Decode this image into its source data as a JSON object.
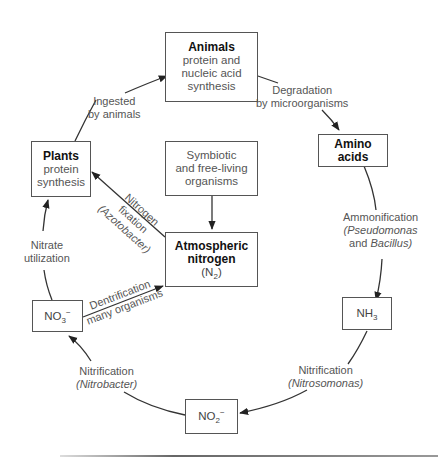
{
  "diagram": {
    "nodes": {
      "animals": {
        "title": "Animals",
        "lines": [
          "protein and",
          "nucleic acid",
          "synthesis"
        ]
      },
      "amino_acids": {
        "title": "Amino acids"
      },
      "plants": {
        "title": "Plants",
        "lines": [
          "protein",
          "synthesis"
        ]
      },
      "symbiotic": {
        "lines": [
          "Symbiotic",
          "and free-living",
          "organisms"
        ]
      },
      "atmospheric": {
        "title_line1": "Atmospheric",
        "title_line2": "nitrogen",
        "formula_base": "(N",
        "formula_sub": "2",
        "formula_end": ")"
      },
      "nh3": {
        "base": "NH",
        "sub": "3"
      },
      "no3": {
        "base": "NO",
        "sub": "3",
        "sup": "−"
      },
      "no2": {
        "base": "NO",
        "sub": "2",
        "sup": "−"
      }
    },
    "edges": {
      "ingested": {
        "line1": "Ingested",
        "line2": "by animals"
      },
      "degradation": {
        "line1": "Degradation",
        "line2": "by microorganisms"
      },
      "ammonification": {
        "line1": "Ammonification",
        "line2_italic": "(Pseudomonas",
        "line3_pre": "and ",
        "line3_italic": "Bacillus)"
      },
      "nitrification_nitrosomonas": {
        "line1": "Nitrification",
        "line2_italic": "(Nitrosomonas)"
      },
      "nitrification_nitrobacter": {
        "line1": "Nitrification",
        "line2_italic": "(Nitrobacter)"
      },
      "nitrate_utilization": {
        "line1": "Nitrate",
        "line2": "utilization"
      },
      "denitrification": {
        "line1": "Dentrification",
        "line2": "many organisms"
      },
      "nitrogen_fixation": {
        "line1": "Nitrogen",
        "line2": "fixation",
        "line3_italic": "(Azotobacter)"
      }
    }
  }
}
